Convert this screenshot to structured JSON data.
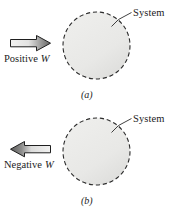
{
  "figure": {
    "background_color": "#ffffff",
    "system_fill_color": "#e9e9e7",
    "system_outline_color": "#2b2b2b",
    "arrow_outline_color": "#1f1f1f",
    "panels": [
      {
        "id": "a",
        "caption": "(a)",
        "system_label": "System",
        "work_label_text": "Positive",
        "work_label_symbol": "W",
        "arrow": {
          "name": "positive-work-arrow",
          "direction": "right",
          "head_color": "#6f6f6f",
          "tail_color": "#f0f0ef"
        }
      },
      {
        "id": "b",
        "caption": "(b)",
        "system_label": "System",
        "work_label_text": "Negative",
        "work_label_symbol": "W",
        "arrow": {
          "name": "negative-work-arrow",
          "direction": "left",
          "head_color": "#5e5e5e",
          "tail_color": "#f0f0ef"
        }
      }
    ]
  }
}
